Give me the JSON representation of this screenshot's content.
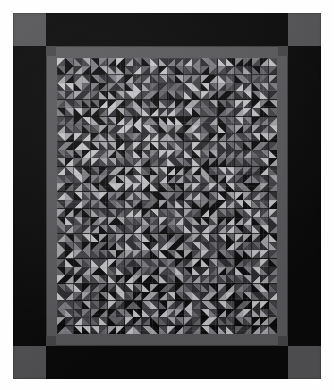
{
  "image": {
    "subject": "patchwork quilt",
    "title": "Pieced quilt with half-square-triangle pinwheel blocks",
    "orientation": "portrait",
    "background_color": "#fdfdfd"
  },
  "quilt": {
    "outer_border": {
      "name": "outer border",
      "color": "#0a0a0a"
    },
    "corner_blocks": {
      "name": "corner squares",
      "color": "#555558",
      "positions": [
        "top-left",
        "top-right",
        "bottom-left",
        "bottom-right"
      ]
    },
    "inner_border": {
      "name": "inner sashing border",
      "color": "#5b5b5e"
    },
    "sashing_corner_blocks": {
      "name": "sashing corner squares",
      "color": "#474749"
    },
    "field": {
      "name": "pieced center field",
      "background_color": "#0b0b0b",
      "columns": 26,
      "rows": 33,
      "unit": "half-square triangle"
    }
  },
  "palette": {
    "black": "#0d0d0d",
    "charcoal": "#2f2f33",
    "dark_gray": "#45454a",
    "mid_gray": "#66666b",
    "gray": "#808086",
    "light_gray": "#a8a8ad",
    "pale": "#c9c9cd"
  },
  "chart_data": {
    "type": "heatmap",
    "xlabel": "column",
    "ylabel": "row",
    "grid": true,
    "legend": "none",
    "tone_keys": [
      "black",
      "charcoal",
      "dark_gray",
      "mid_gray",
      "gray",
      "light_gray",
      "pale"
    ],
    "rotation_codes": [
      0,
      1,
      2,
      3
    ],
    "note": "Each cell is a half-square-triangle unit: tone_a fills one triangle, tone_b the other; rotation gives the diagonal direction.",
    "cells": []
  }
}
